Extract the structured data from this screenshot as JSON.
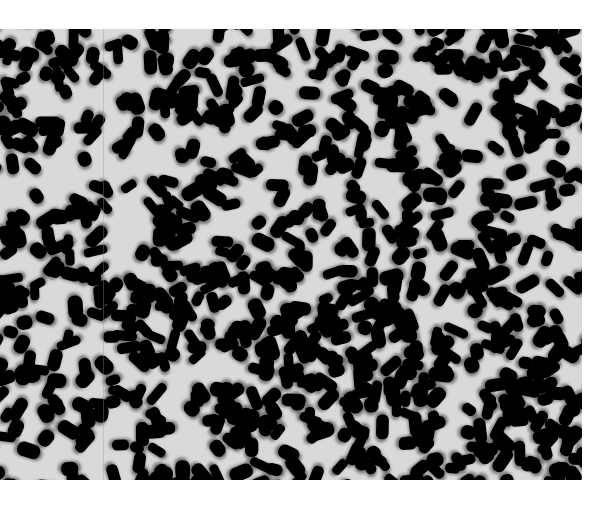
{
  "image": {
    "subject": "dense field of black elongated particles (seed-like grains) on a light background",
    "colors": {
      "particle": "#000000",
      "background": "#d9d9d9",
      "page": "#ffffff"
    },
    "region": {
      "x": 0,
      "y": 29,
      "width": 582,
      "height": 451
    },
    "particle_count_approx": 900,
    "seed": 7
  }
}
